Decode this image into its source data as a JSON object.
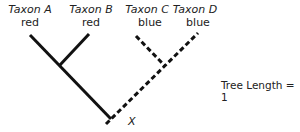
{
  "taxa": [
    {
      "name": "Taxon A",
      "state": "red",
      "branch": "solid"
    },
    {
      "name": "Taxon B",
      "state": "red",
      "branch": "solid"
    },
    {
      "name": "Taxon C",
      "state": "blue",
      "branch": "dashed"
    },
    {
      "name": "Taxon D",
      "state": "blue",
      "branch": "dashed"
    }
  ],
  "root_label": "X",
  "tree_length_label": "Tree Length = 1"
}
